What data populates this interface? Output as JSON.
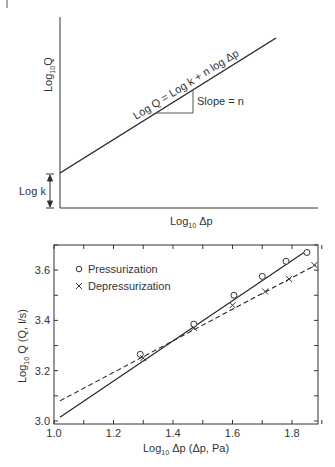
{
  "figure": {
    "corner_mark": "|"
  },
  "chart_data": [
    {
      "type": "line",
      "title": "",
      "schematic": true,
      "xlabel": "Log10 Δp",
      "xlabel_base": "Log",
      "xlabel_sub": "10",
      "xlabel_tail": " Δp",
      "ylabel": "Log10Q",
      "ylabel_base": "Log",
      "ylabel_sub": "10",
      "ylabel_tail": "Q",
      "equation": "Log Q = Log k + n log Δp",
      "slope_label": "Slope = n",
      "intercept_label": "Log k",
      "grid": false,
      "series": [
        {
          "name": "Log Q = Log k + n log Δp",
          "style": "solid",
          "x": [
            0,
            1
          ],
          "y": [
            0.18,
            0.89
          ]
        }
      ]
    },
    {
      "type": "scatter",
      "title": "",
      "xlabel": "Log10 Δp (Δp, Pa)",
      "xlabel_base": "Log",
      "xlabel_sub": "10",
      "xlabel_tail": " Δp (Δp, Pa)",
      "ylabel": "Log10 Q (Q, l/s)",
      "ylabel_base": "Log",
      "ylabel_sub": "10",
      "ylabel_tail": " Q (Q, l/s)",
      "xlim": [
        1.0,
        1.89
      ],
      "ylim": [
        3.0,
        3.7
      ],
      "xticks": [
        "1.0",
        "1.2",
        "1.4",
        "1.6",
        "1.8"
      ],
      "yticks": [
        "3.0",
        "3.2",
        "3.4",
        "3.6"
      ],
      "grid": false,
      "legend_position": "upper left",
      "series": [
        {
          "name": "Pressurization",
          "marker": "o",
          "x": [
            1.29,
            1.47,
            1.605,
            1.7,
            1.78,
            1.85
          ],
          "y": [
            3.265,
            3.385,
            3.5,
            3.575,
            3.635,
            3.67
          ],
          "fit_style": "solid",
          "fit": {
            "x": [
              1.02,
              1.84
            ],
            "y": [
              3.015,
              3.67
            ]
          }
        },
        {
          "name": "Depressurization",
          "marker": "x",
          "x": [
            1.3,
            1.47,
            1.6,
            1.71,
            1.79,
            1.875
          ],
          "y": [
            3.25,
            3.37,
            3.46,
            3.515,
            3.565,
            3.62
          ],
          "fit_style": "dashed",
          "fit": {
            "x": [
              1.02,
              1.88
            ],
            "y": [
              3.08,
              3.62
            ]
          }
        }
      ]
    }
  ]
}
